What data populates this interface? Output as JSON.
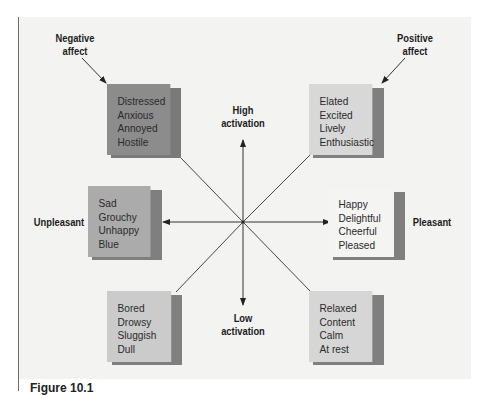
{
  "figure": {
    "caption": "Figure 10.1",
    "axes": {
      "top": [
        "High",
        "activation"
      ],
      "bottom": [
        "Low",
        "activation"
      ],
      "left": "Unpleasant",
      "right": "Pleasant"
    },
    "corner_labels": {
      "top_left": [
        "Negative",
        "affect"
      ],
      "top_right": [
        "Positive",
        "affect"
      ]
    },
    "boxes": {
      "high_unpleasant": {
        "words": [
          "Distressed",
          "Anxious",
          "Annoyed",
          "Hostile"
        ],
        "color": "#8c8c8c"
      },
      "high_pleasant": {
        "words": [
          "Elated",
          "Excited",
          "Lively",
          "Enthusiastic"
        ],
        "color": "#d8d8d8"
      },
      "unpleasant": {
        "words": [
          "Sad",
          "Grouchy",
          "Unhappy",
          "Blue"
        ],
        "color": "#ababab"
      },
      "pleasant": {
        "words": [
          "Happy",
          "Delightful",
          "Cheerful",
          "Pleased"
        ],
        "color": "#f4f4f3"
      },
      "low_unpleasant": {
        "words": [
          "Bored",
          "Drowsy",
          "Sluggish",
          "Dull"
        ],
        "color": "#cbcbcb"
      },
      "low_pleasant": {
        "words": [
          "Relaxed",
          "Content",
          "Calm",
          "At rest"
        ],
        "color": "#d6d6d6"
      }
    },
    "colors": {
      "background": "#f3f3f2",
      "line": "#333333",
      "shadow": "#7f7f7f"
    }
  }
}
